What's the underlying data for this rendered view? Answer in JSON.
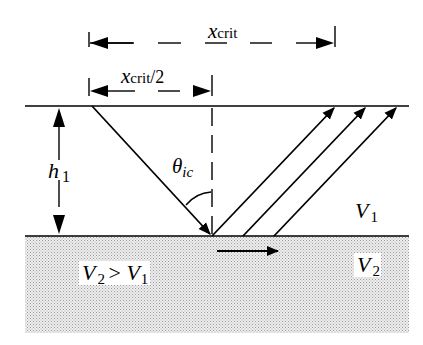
{
  "diagram": {
    "labels": {
      "x_crit": {
        "main": "x",
        "sub": "crit"
      },
      "x_crit_half": {
        "main": "x",
        "sub": "crit",
        "suffix": "/2"
      },
      "h1": {
        "main": "h",
        "sub": "1"
      },
      "theta": {
        "main": "θ",
        "sub": "ic"
      },
      "v1": {
        "main": "V",
        "sub": "1"
      },
      "v2": {
        "main": "V",
        "sub": "2"
      },
      "v2_gt_v1": {
        "a": "V",
        "a_sub": "2",
        "op": " > ",
        "b": "V",
        "b_sub": "1"
      }
    },
    "geometry": {
      "surface_y": 106,
      "interface_y": 236,
      "critical_point_x": 212,
      "source_x": 92,
      "head_wave_arrow": "right",
      "upgoing_rays": 3
    },
    "colors": {
      "line": "#000000",
      "lower_layer_fill": "#d8d8d8",
      "background": "#ffffff"
    }
  }
}
